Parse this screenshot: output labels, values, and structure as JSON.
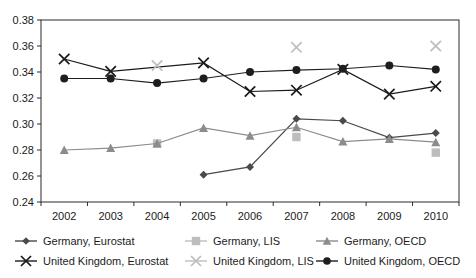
{
  "chart_data": {
    "type": "line",
    "title": "",
    "subtitle": "",
    "xlabel": "",
    "ylabel": "",
    "categories": [
      "2002",
      "2003",
      "2004",
      "2005",
      "2006",
      "2007",
      "2008",
      "2009",
      "2010"
    ],
    "ylim": [
      0.24,
      0.38
    ],
    "ytick_labels": [
      "0.24",
      "0.26",
      "0.28",
      "0.30",
      "0.32",
      "0.34",
      "0.36",
      "0.38"
    ],
    "ytick_values": [
      0.24,
      0.26,
      0.28,
      0.3,
      0.32,
      0.34,
      0.36,
      0.38
    ],
    "grid": false,
    "legend_position": "bottom",
    "series": [
      {
        "name": "Germany, Eurostat",
        "marker": "diamond",
        "color": "#4a4a4a",
        "connected": true,
        "x": [
          "2005",
          "2006",
          "2007",
          "2008",
          "2009",
          "2010"
        ],
        "values": [
          0.261,
          0.267,
          0.304,
          0.3025,
          0.2895,
          0.293
        ]
      },
      {
        "name": "Germany, LIS",
        "marker": "square",
        "color": "#bdbdbd",
        "connected": false,
        "x": [
          "2004",
          "2007",
          "2010"
        ],
        "values": [
          0.285,
          0.29,
          0.278
        ]
      },
      {
        "name": "Germany, OECD",
        "marker": "triangle",
        "color": "#8c8c8c",
        "connected": true,
        "x": [
          "2002",
          "2003",
          "2004",
          "2005",
          "2006",
          "2007",
          "2008",
          "2009",
          "2010"
        ],
        "values": [
          0.28,
          0.2815,
          0.285,
          0.297,
          0.291,
          0.2975,
          0.2865,
          0.2885,
          0.286
        ]
      },
      {
        "name": "United Kingdom, Eurostat",
        "marker": "cross",
        "color": "#1a1a1a",
        "connected": true,
        "x": [
          "2002",
          "2003",
          "2005",
          "2006",
          "2007",
          "2008",
          "2009",
          "2010"
        ],
        "values": [
          0.35,
          0.3405,
          0.347,
          0.325,
          0.326,
          0.342,
          0.323,
          0.329
        ]
      },
      {
        "name": "United Kingdom, LIS",
        "marker": "cross",
        "color": "#bdbdbd",
        "connected": false,
        "x": [
          "2004",
          "2007",
          "2010"
        ],
        "values": [
          0.345,
          0.359,
          0.36
        ]
      },
      {
        "name": "United Kingdom, OECD",
        "marker": "circle",
        "color": "#1e1e1e",
        "connected": true,
        "x": [
          "2002",
          "2003",
          "2004",
          "2005",
          "2006",
          "2007",
          "2008",
          "2009",
          "2010"
        ],
        "values": [
          0.335,
          0.335,
          0.3315,
          0.335,
          0.34,
          0.3415,
          0.3425,
          0.345,
          0.342
        ]
      }
    ]
  },
  "axes": {
    "y": {
      "labels": [
        "0.38",
        "0.36",
        "0.34",
        "0.32",
        "0.30",
        "0.28",
        "0.26",
        "0.24"
      ]
    },
    "x": {
      "labels": [
        "2002",
        "2003",
        "2004",
        "2005",
        "2006",
        "2007",
        "2008",
        "2009",
        "2010"
      ]
    }
  },
  "legend": {
    "items": [
      {
        "label": "Germany, Eurostat",
        "marker": "diamond",
        "color": "#4a4a4a",
        "line": true
      },
      {
        "label": "Germany, LIS",
        "marker": "square",
        "color": "#bdbdbd",
        "line": true
      },
      {
        "label": "Germany, OECD",
        "marker": "triangle",
        "color": "#8c8c8c",
        "line": true
      },
      {
        "label": "United Kingdom, Eurostat",
        "marker": "cross",
        "color": "#1a1a1a",
        "line": true
      },
      {
        "label": "United Kingdom, LIS",
        "marker": "cross",
        "color": "#bdbdbd",
        "line": true
      },
      {
        "label": "United Kingdom, OECD",
        "marker": "circle",
        "color": "#1e1e1e",
        "line": true
      }
    ]
  }
}
